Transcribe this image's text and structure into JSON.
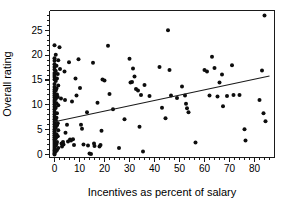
{
  "chart_data": {
    "type": "scatter",
    "title": "",
    "xlabel": "Incentives as percent of salary",
    "ylabel": "Overall rating",
    "xlim": [
      -2,
      88
    ],
    "ylim": [
      -0.6,
      29
    ],
    "grid": false,
    "legend": "none",
    "x_ticks_major": [
      0,
      10,
      20,
      30,
      40,
      50,
      60,
      70,
      80
    ],
    "x_tick_labels": [
      "0",
      "10",
      "20",
      "30",
      "40",
      "50",
      "60",
      "70",
      "80"
    ],
    "x_tick_minor_step": 2,
    "y_ticks_major": [
      0,
      5,
      10,
      15,
      20,
      25
    ],
    "y_tick_labels": [
      "0",
      "5",
      "10",
      "15",
      "20",
      "25"
    ],
    "y_tick_minor_step": 1,
    "marker": "filled-circle",
    "marker_color": "#0d0d0d",
    "marker_size": 2.0,
    "trendline": {
      "visible": true,
      "label": "least-squares fit",
      "x_start": 0,
      "y_start": 6.6,
      "x_end": 86,
      "y_end": 15.8,
      "color": "#1a1a1a"
    },
    "points": [
      [
        0.0,
        22.0
      ],
      [
        0.0,
        19.4
      ],
      [
        0.0,
        18.9
      ],
      [
        0.0,
        18.2
      ],
      [
        0.0,
        17.6
      ],
      [
        0.0,
        17.1
      ],
      [
        0.0,
        16.4
      ],
      [
        0.0,
        16.0
      ],
      [
        0.0,
        15.6
      ],
      [
        0.0,
        15.1
      ],
      [
        0.0,
        14.2
      ],
      [
        0.0,
        13.6
      ],
      [
        0.0,
        13.1
      ],
      [
        0.0,
        12.7
      ],
      [
        0.0,
        12.3
      ],
      [
        0.0,
        11.9
      ],
      [
        0.0,
        11.5
      ],
      [
        0.0,
        11.0
      ],
      [
        0.0,
        10.6
      ],
      [
        0.0,
        10.1
      ],
      [
        0.0,
        9.6
      ],
      [
        0.0,
        9.1
      ],
      [
        0.0,
        8.6
      ],
      [
        0.0,
        8.1
      ],
      [
        0.0,
        7.6
      ],
      [
        0.0,
        7.1
      ],
      [
        0.0,
        6.6
      ],
      [
        0.0,
        6.1
      ],
      [
        0.0,
        5.6
      ],
      [
        0.0,
        5.1
      ],
      [
        0.0,
        4.7
      ],
      [
        0.0,
        4.3
      ],
      [
        0.0,
        3.9
      ],
      [
        0.0,
        3.5
      ],
      [
        0.0,
        3.1
      ],
      [
        0.0,
        2.7
      ],
      [
        0.0,
        2.3
      ],
      [
        0.0,
        1.9
      ],
      [
        0.0,
        1.5
      ],
      [
        0.0,
        1.1
      ],
      [
        0.0,
        0.8
      ],
      [
        0.0,
        0.5
      ],
      [
        0.0,
        0.2
      ],
      [
        0.0,
        0.0
      ],
      [
        0.5,
        20.1
      ],
      [
        0.5,
        16.8
      ],
      [
        0.5,
        14.8
      ],
      [
        0.5,
        12.9
      ],
      [
        0.5,
        11.2
      ],
      [
        0.5,
        9.4
      ],
      [
        0.5,
        6.9
      ],
      [
        0.5,
        5.4
      ],
      [
        0.5,
        3.3
      ],
      [
        0.5,
        1.8
      ],
      [
        0.5,
        0.6
      ],
      [
        0.8,
        17.9
      ],
      [
        0.8,
        13.3
      ],
      [
        0.8,
        10.3
      ],
      [
        0.8,
        7.4
      ],
      [
        0.8,
        4.1
      ],
      [
        0.8,
        2.1
      ],
      [
        1.0,
        15.3
      ],
      [
        1.0,
        12.1
      ],
      [
        1.0,
        8.3
      ],
      [
        1.0,
        5.9
      ],
      [
        1.0,
        2.5
      ],
      [
        1.0,
        0.9
      ],
      [
        1.3,
        16.2
      ],
      [
        1.3,
        11.6
      ],
      [
        1.3,
        6.3
      ],
      [
        1.3,
        3.7
      ],
      [
        1.5,
        19.0
      ],
      [
        1.5,
        13.9
      ],
      [
        1.5,
        9.9
      ],
      [
        1.5,
        4.9
      ],
      [
        1.5,
        1.3
      ],
      [
        2.0,
        21.6
      ],
      [
        2.2,
        17.2
      ],
      [
        2.6,
        11.3
      ],
      [
        2.8,
        2.2
      ],
      [
        3.0,
        1.6
      ],
      [
        3.4,
        2.5
      ],
      [
        3.6,
        2.0
      ],
      [
        4.0,
        16.7
      ],
      [
        4.2,
        11.0
      ],
      [
        4.4,
        4.4
      ],
      [
        5.0,
        6.0
      ],
      [
        5.4,
        2.6
      ],
      [
        5.8,
        18.6
      ],
      [
        6.2,
        3.0
      ],
      [
        6.6,
        2.8
      ],
      [
        7.0,
        10.7
      ],
      [
        7.4,
        3.1
      ],
      [
        7.8,
        1.9
      ],
      [
        8.4,
        15.3
      ],
      [
        8.8,
        11.9
      ],
      [
        9.6,
        19.2
      ],
      [
        10.2,
        13.4
      ],
      [
        10.6,
        6.0
      ],
      [
        11.0,
        5.2
      ],
      [
        11.6,
        2.0
      ],
      [
        13.0,
        8.5
      ],
      [
        13.4,
        1.8
      ],
      [
        14.0,
        0.2
      ],
      [
        14.6,
        0.1
      ],
      [
        15.4,
        18.5
      ],
      [
        15.8,
        2.2
      ],
      [
        16.0,
        1.7
      ],
      [
        17.2,
        10.4
      ],
      [
        18.0,
        1.6
      ],
      [
        18.4,
        1.9
      ],
      [
        18.8,
        4.8
      ],
      [
        19.2,
        15.1
      ],
      [
        20.0,
        14.9
      ],
      [
        21.4,
        21.9
      ],
      [
        22.0,
        12.2
      ],
      [
        23.4,
        9.1
      ],
      [
        25.8,
        1.3
      ],
      [
        28.0,
        7.1
      ],
      [
        30.0,
        19.3
      ],
      [
        30.4,
        14.5
      ],
      [
        31.0,
        14.6
      ],
      [
        31.4,
        17.3
      ],
      [
        32.0,
        15.7
      ],
      [
        32.6,
        13.2
      ],
      [
        33.4,
        12.9
      ],
      [
        34.0,
        5.6
      ],
      [
        34.6,
        12.0
      ],
      [
        35.4,
        0.6
      ],
      [
        36.0,
        14.0
      ],
      [
        38.0,
        11.8
      ],
      [
        42.0,
        17.6
      ],
      [
        43.0,
        9.4
      ],
      [
        44.4,
        7.3
      ],
      [
        45.4,
        25.0
      ],
      [
        46.0,
        17.0
      ],
      [
        46.6,
        11.9
      ],
      [
        49.0,
        11.4
      ],
      [
        51.0,
        13.7
      ],
      [
        52.2,
        11.9
      ],
      [
        52.6,
        10.2
      ],
      [
        53.0,
        9.3
      ],
      [
        53.6,
        8.5
      ],
      [
        56.4,
        2.4
      ],
      [
        60.0,
        17.0
      ],
      [
        61.0,
        16.7
      ],
      [
        62.0,
        11.9
      ],
      [
        63.0,
        19.7
      ],
      [
        64.0,
        17.4
      ],
      [
        65.2,
        11.7
      ],
      [
        66.0,
        14.5
      ],
      [
        67.0,
        16.1
      ],
      [
        67.4,
        9.7
      ],
      [
        69.0,
        11.8
      ],
      [
        71.0,
        18.0
      ],
      [
        71.6,
        12.0
      ],
      [
        74.0,
        12.0
      ],
      [
        76.0,
        5.1
      ],
      [
        76.4,
        2.8
      ],
      [
        82.0,
        11.0
      ],
      [
        83.0,
        16.9
      ],
      [
        83.6,
        8.3
      ],
      [
        84.0,
        28.0
      ],
      [
        84.4,
        6.7
      ]
    ]
  }
}
